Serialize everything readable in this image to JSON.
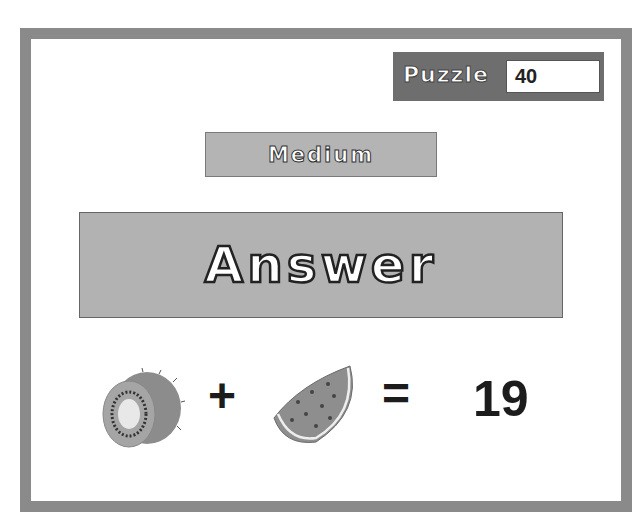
{
  "puzzle": {
    "label": "Puzzle",
    "number": "40"
  },
  "difficulty": {
    "label": "Medium"
  },
  "answer_button": {
    "label": "Answer"
  },
  "equation": {
    "term1": "kiwi-icon",
    "operator": "+",
    "term2": "watermelon-slice-icon",
    "equals": "=",
    "result": "19"
  },
  "colors": {
    "frame": "#8a8a8a",
    "puzzle_bg": "#6e6e6e",
    "panel_bg": "#b4b4b4",
    "text_dark": "#1c1c1c"
  }
}
